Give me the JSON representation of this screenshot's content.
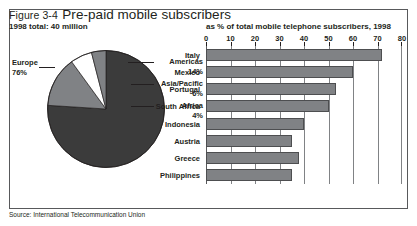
{
  "figure": {
    "number": "Figure 3-4",
    "title": "Pre-paid mobile subscribers",
    "subtitle": "1998 total: 40 million",
    "axis_caption": "as % of total mobile telephone subscribers, 1998",
    "source": "Source: International Telecommunication Union"
  },
  "colors": {
    "pie_major": "#3b3b3b",
    "pie_mid": "#808285",
    "pie_light": "#ffffff",
    "bar_fill": "#808285",
    "bar_stroke": "#4d4e50",
    "frame": "#58595b",
    "text": "#231f20",
    "grid": "#808285"
  },
  "chart_data": [
    {
      "type": "pie",
      "title": "Pre-paid mobile subscribers",
      "subtitle": "1998 total: 40 million",
      "unit": "%",
      "labels": [
        "Europe",
        "Americas",
        "Asia/Pacific",
        "Africa"
      ],
      "values": [
        76,
        14,
        6,
        4
      ],
      "value_labels": [
        "76%",
        "14%",
        "6%",
        "4%"
      ],
      "slice_colors": [
        "#3b3b3b",
        "#808285",
        "#ffffff",
        "#808285"
      ],
      "legend": "labels-with-leader-lines",
      "start_angle_deg": 0,
      "direction": "clockwise"
    },
    {
      "type": "bar",
      "orientation": "horizontal",
      "title": "",
      "xlabel": "as % of total mobile telephone subscribers, 1998",
      "ylabel": "",
      "xlim": [
        0,
        80
      ],
      "xticks": [
        0,
        10,
        20,
        30,
        40,
        50,
        60,
        70,
        80
      ],
      "grid": true,
      "categories": [
        "Italy",
        "Mexico",
        "Portugal",
        "South Africa",
        "Indonesia",
        "Austria",
        "Greece",
        "Philippines"
      ],
      "values": [
        72,
        60,
        53,
        50,
        40,
        35,
        38,
        35
      ]
    }
  ]
}
